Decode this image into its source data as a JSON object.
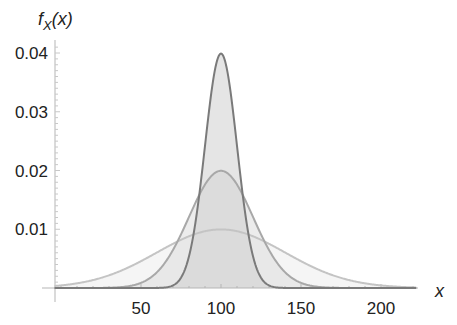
{
  "chart_data": {
    "type": "area",
    "title": "",
    "xlabel": "x",
    "ylabel": "f_X(x)",
    "ylabel_display": {
      "main": "f",
      "sub": "X",
      "rest": "(x)"
    },
    "xlim": [
      -4,
      225
    ],
    "ylim": [
      0,
      0.041
    ],
    "x_ticks": [
      50,
      100,
      150,
      200
    ],
    "x_tick_labels": [
      "50",
      "100",
      "150",
      "200"
    ],
    "y_ticks": [
      0.01,
      0.02,
      0.03,
      0.04
    ],
    "y_tick_labels": [
      "0.01",
      "0.02",
      "0.03",
      "0.04"
    ],
    "grid": false,
    "legend": null,
    "series": [
      {
        "name": "Normal(mean=100, sd=40)",
        "distribution": "normal",
        "mean": 100,
        "sd": 40,
        "peak": 0.00997,
        "stroke": "#c4c4c4",
        "fill": "#ececec"
      },
      {
        "name": "Normal(mean=100, sd=20)",
        "distribution": "normal",
        "mean": 100,
        "sd": 20,
        "peak": 0.01995,
        "stroke": "#a8a8a8",
        "fill": "#dcdcdc"
      },
      {
        "name": "Normal(mean=100, sd=10)",
        "distribution": "normal",
        "mean": 100,
        "sd": 10,
        "peak": 0.03989,
        "stroke": "#7a7a7a",
        "fill": "#cfcfcf"
      }
    ]
  },
  "layout": {
    "plot_origin_px": [
      55,
      288
    ],
    "x_px_per_unit": 1.6,
    "x_zero_px": 61,
    "y_px_per_unit": 5875,
    "x_axis_end_px": 418
  }
}
